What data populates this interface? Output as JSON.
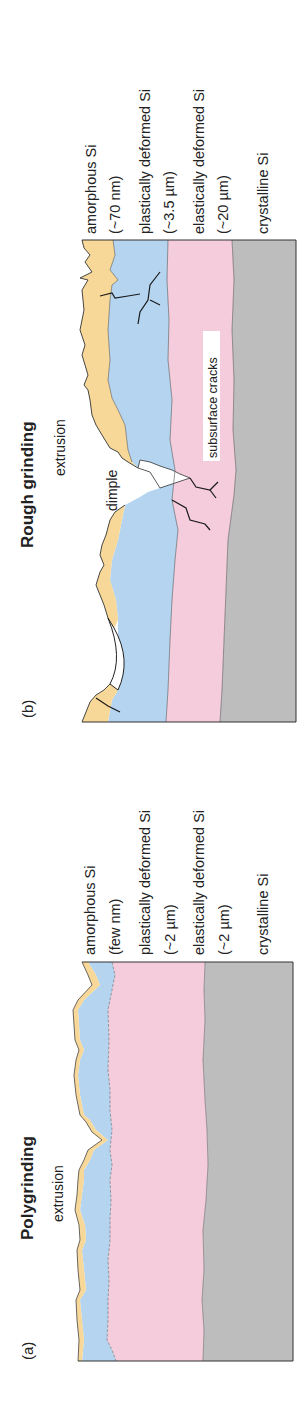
{
  "figure": {
    "orientation": "rotated 90 degrees counter-clockwise",
    "colors": {
      "amorphous": "#F8D898",
      "plastic": "#B4D4F0",
      "elastic": "#F4CCDC",
      "crystalline": "#BDBDBD",
      "outline": "#333333",
      "crack": "#1a1a1a"
    }
  },
  "panel_a": {
    "tag": "(a)",
    "title": "Polygrinding",
    "annotation": "extrusion",
    "layers": [
      {
        "name": "amorphous Si",
        "thickness": "(few nm)"
      },
      {
        "name": "plastically deformed Si",
        "thickness": "(~2 µm)"
      },
      {
        "name": "elastically deformed Si",
        "thickness": "(~2 µm)"
      },
      {
        "name": "crystalline Si",
        "thickness": ""
      }
    ]
  },
  "panel_b": {
    "tag": "(b)",
    "title": "Rough grinding",
    "annotations": {
      "extrusion": "extrusion",
      "dimple": "dimple",
      "cracks": "subsurface cracks"
    },
    "layers": [
      {
        "name": "amorphous Si",
        "thickness": "(~70 nm)"
      },
      {
        "name": "plastically deformed Si",
        "thickness": "(~3.5 µm)"
      },
      {
        "name": "elastically deformed Si",
        "thickness": "(~20 µm)"
      },
      {
        "name": "crystalline Si",
        "thickness": ""
      }
    ]
  }
}
